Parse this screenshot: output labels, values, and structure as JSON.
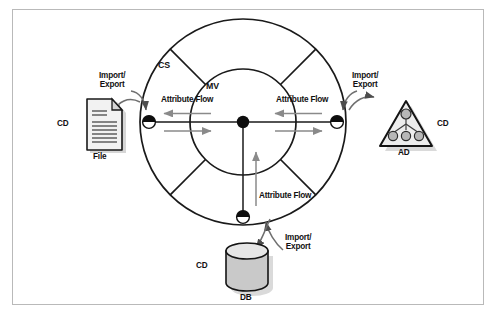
{
  "figure": {
    "border_color": "#b9b9b9",
    "background": "#ffffff",
    "line_color": "#1a1a1a",
    "arrow_color": "#8a8a8a",
    "shape_fill": "#d0d0d0"
  },
  "rings": {
    "outer_label": "CS",
    "inner_label": "MV",
    "outer_label_expanded": "CS",
    "inner_label_expanded": "MV"
  },
  "connectors": [
    {
      "id": "left",
      "name": "cs-connector-left",
      "flow_label": "Attribute Flow"
    },
    {
      "id": "right",
      "name": "cs-connector-right",
      "flow_label": "Attribute Flow"
    },
    {
      "id": "bottom",
      "name": "cs-connector-bottom",
      "flow_label": "Attribute Flow"
    }
  ],
  "flows": {
    "left_label": "Attribute Flow",
    "right_label": "Attribute Flow",
    "bottom_label": "Attribute Flow"
  },
  "io_labels": {
    "file": {
      "line1": "Import/",
      "line2": "Export"
    },
    "ad": {
      "line1": "Import/",
      "line2": "Export"
    },
    "db": {
      "line1": "Import/",
      "line2": "Export"
    }
  },
  "endpoints": [
    {
      "id": "file",
      "icon": "document-icon",
      "cd_label": "CD",
      "name_label": "File"
    },
    {
      "id": "ad",
      "icon": "directory-tree-triangle-icon",
      "cd_label": "CD",
      "name_label": "AD"
    },
    {
      "id": "db",
      "icon": "database-cylinder-icon",
      "cd_label": "CD",
      "name_label": "DB"
    }
  ]
}
